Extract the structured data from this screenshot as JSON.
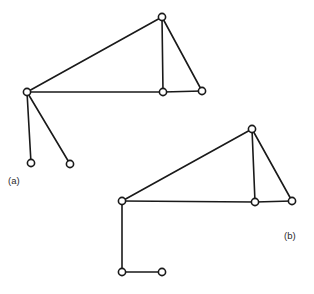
{
  "figure": {
    "background_color": "#ffffff",
    "stroke_color": "#1a1a1a",
    "node_fill_color": "#ffffff",
    "label_color": "#2a2a2a",
    "node_radius": 3.6,
    "edge_width": 1.6,
    "panels": [
      {
        "id": "a",
        "label": "(a)",
        "label_x": 8,
        "label_y": 184,
        "nodes": [
          {
            "id": "a-hub",
            "name": "hub-node",
            "x": 27,
            "y": 92
          },
          {
            "id": "a-apex",
            "name": "apex-node",
            "x": 162,
            "y": 17
          },
          {
            "id": "a-mid",
            "name": "middle-node",
            "x": 163,
            "y": 92
          },
          {
            "id": "a-right",
            "name": "right-node",
            "x": 202,
            "y": 91
          },
          {
            "id": "a-leaf1",
            "name": "left-leaf-node",
            "x": 31,
            "y": 163
          },
          {
            "id": "a-leaf2",
            "name": "right-leaf-node",
            "x": 70,
            "y": 164
          }
        ],
        "edges": [
          {
            "name": "hub-to-apex",
            "points": [
              [
                27,
                92
              ],
              [
                162,
                17
              ]
            ]
          },
          {
            "name": "hub-to-middle",
            "points": [
              [
                27,
                92
              ],
              [
                163,
                92
              ]
            ]
          },
          {
            "name": "apex-to-middle",
            "points": [
              [
                162,
                17
              ],
              [
                163,
                92
              ]
            ]
          },
          {
            "name": "apex-to-right",
            "points": [
              [
                162,
                17
              ],
              [
                202,
                91
              ]
            ]
          },
          {
            "name": "middle-to-right",
            "points": [
              [
                163,
                92
              ],
              [
                202,
                91
              ]
            ]
          },
          {
            "name": "hub-to-leaf1",
            "points": [
              [
                27,
                92
              ],
              [
                31,
                163
              ]
            ]
          },
          {
            "name": "hub-to-leaf2",
            "points": [
              [
                27,
                92
              ],
              [
                70,
                164
              ]
            ]
          }
        ]
      },
      {
        "id": "b",
        "label": "(b)",
        "label_x": 284,
        "label_y": 239,
        "nodes": [
          {
            "id": "b-hub",
            "name": "hub-node",
            "x": 122,
            "y": 201
          },
          {
            "id": "b-apex",
            "name": "apex-node",
            "x": 252,
            "y": 129
          },
          {
            "id": "b-mid",
            "name": "middle-node",
            "x": 255,
            "y": 202
          },
          {
            "id": "b-right",
            "name": "right-node",
            "x": 292,
            "y": 201
          },
          {
            "id": "b-leaf1",
            "name": "left-leaf-node",
            "x": 122,
            "y": 272
          },
          {
            "id": "b-leaf2",
            "name": "right-leaf-node",
            "x": 162,
            "y": 272
          }
        ],
        "edges": [
          {
            "name": "hub-to-apex",
            "points": [
              [
                122,
                201
              ],
              [
                252,
                129
              ]
            ]
          },
          {
            "name": "hub-to-middle",
            "points": [
              [
                122,
                201
              ],
              [
                255,
                202
              ]
            ]
          },
          {
            "name": "apex-to-middle",
            "points": [
              [
                252,
                129
              ],
              [
                255,
                202
              ]
            ]
          },
          {
            "name": "apex-to-right",
            "points": [
              [
                252,
                129
              ],
              [
                292,
                201
              ]
            ]
          },
          {
            "name": "middle-to-right",
            "points": [
              [
                255,
                202
              ],
              [
                292,
                201
              ]
            ]
          },
          {
            "name": "hub-to-leaf1",
            "points": [
              [
                122,
                201
              ],
              [
                122,
                272
              ]
            ]
          },
          {
            "name": "leaf1-to-leaf2",
            "points": [
              [
                122,
                272
              ],
              [
                162,
                272
              ]
            ]
          }
        ]
      }
    ]
  }
}
